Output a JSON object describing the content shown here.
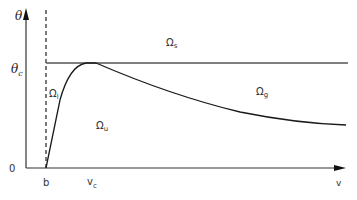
{
  "diagram": {
    "axes": {
      "y_label": "θ",
      "x_label": "v",
      "origin_label": "0",
      "y_tick_label": "θ",
      "y_tick_sub": "c",
      "x_ticks": [
        {
          "label": "b",
          "sub": ""
        },
        {
          "label": "v",
          "sub": "c"
        }
      ]
    },
    "regions": [
      {
        "id": "s",
        "label": "Ω",
        "sub": "s"
      },
      {
        "id": "l",
        "label": "Ω",
        "sub": "l"
      },
      {
        "id": "u",
        "label": "Ω",
        "sub": "u"
      },
      {
        "id": "g",
        "label": "Ω",
        "sub": "g"
      }
    ],
    "lines": {
      "critical_level": "θ_c horizontal line",
      "asymptote": "dashed vertical line at v = b",
      "curve": "boundary curve rising from b to peak at v_c touching θ_c, then decaying"
    },
    "colors": {
      "stroke": "#1a1a1a",
      "axis": "#333333",
      "critical_line": "#555555"
    }
  }
}
